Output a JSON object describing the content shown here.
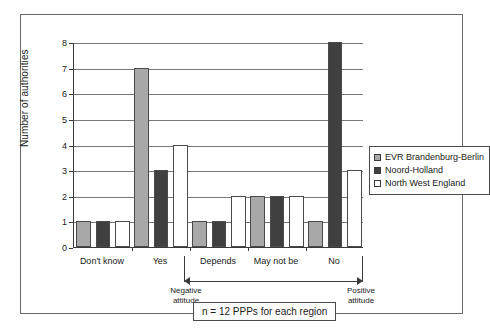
{
  "chart_data": {
    "type": "bar",
    "title": "",
    "subtitle": "",
    "xlabel": "",
    "ylabel": "Number of authorities",
    "ylim": [
      0,
      8
    ],
    "ytick_values": [
      0,
      1,
      2,
      3,
      4,
      5,
      6,
      7,
      8
    ],
    "ytick_labels": [
      "0",
      "1",
      "2",
      "3",
      "4",
      "5",
      "6",
      "7",
      "8"
    ],
    "grid": true,
    "legend_position": "right",
    "categories": [
      "Don't know",
      "Yes",
      "Depends",
      "May not be",
      "No"
    ],
    "series": [
      {
        "name": "EVR Brandenburg-Berlin",
        "color": "#a8a8a8",
        "values": [
          1,
          7,
          1,
          2,
          1
        ]
      },
      {
        "name": "Noord-Holland",
        "color": "#404040",
        "values": [
          1,
          3,
          1,
          2,
          8
        ]
      },
      {
        "name": "North West England",
        "color": "#ffffff",
        "values": [
          1,
          4,
          2,
          2,
          3
        ]
      }
    ],
    "annotations": {
      "left_attitude": "Negative\nattitude",
      "left_attitude_line1": "Negative",
      "left_attitude_line2": "attitude",
      "right_attitude_line1": "Positive",
      "right_attitude_line2": "attitude",
      "footnote": "n = 12 PPPs for each region"
    }
  },
  "legend": {
    "items": [
      {
        "label": "EVR Brandenburg-Berlin",
        "swatch": "evr"
      },
      {
        "label": "Noord-Holland",
        "swatch": "noord"
      },
      {
        "label": "North West England",
        "swatch": "nwe"
      }
    ]
  },
  "colors": {
    "evr": "#a8a8a8",
    "noord": "#404040",
    "nwe": "#ffffff",
    "axis": "#3a3a3a",
    "grid": "#777777",
    "frame": "#6a6a6a"
  }
}
